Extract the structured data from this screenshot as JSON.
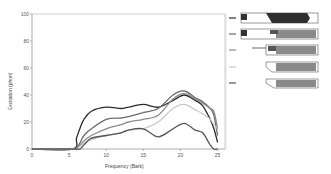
{
  "chart_data": {
    "type": "line",
    "title": "",
    "xlabel": "Frequency (Bark)",
    "ylabel": "Excitation (phon)",
    "xlim": [
      0,
      26
    ],
    "ylim": [
      0,
      100
    ],
    "xticks": [
      0,
      5,
      10,
      15,
      20,
      25
    ],
    "yticks": [
      0,
      20,
      40,
      60,
      80,
      100
    ],
    "grid": false,
    "legend_position": "right (schematic icons)",
    "x": [
      0,
      5.5,
      6,
      6.5,
      7,
      8,
      10,
      12,
      13,
      15,
      17,
      19,
      20.5,
      22,
      23,
      24,
      24.5,
      25
    ],
    "series": [
      {
        "name": "Curve 1",
        "color": "#2a2a2a",
        "values": [
          0,
          0,
          8,
          16,
          22,
          28,
          31,
          30,
          31,
          33,
          31,
          36,
          40,
          36,
          32,
          22,
          15,
          5
        ]
      },
      {
        "name": "Curve 2",
        "color": "#6a6a6a",
        "values": [
          0,
          0,
          0,
          5,
          10,
          15,
          22,
          23,
          24,
          27,
          30,
          40,
          43,
          38,
          35,
          30,
          25,
          10
        ]
      },
      {
        "name": "Curve 3",
        "color": "#8a8a8a",
        "values": [
          0,
          0,
          0,
          3,
          6,
          10,
          15,
          18,
          20,
          22,
          25,
          37,
          41,
          37,
          34,
          30,
          28,
          15
        ]
      },
      {
        "name": "Curve 4",
        "color": "#c8c8c8",
        "values": [
          0,
          0,
          0,
          2,
          4,
          7,
          10,
          12,
          14,
          15,
          20,
          30,
          33,
          29,
          26,
          22,
          18,
          15
        ]
      },
      {
        "name": "Curve 5",
        "color": "#555555",
        "values": [
          0,
          0,
          0,
          0,
          3,
          8,
          10,
          12,
          14,
          15,
          9,
          15,
          19,
          14,
          12,
          3,
          0,
          0
        ]
      }
    ]
  },
  "legend": {
    "items": [
      {
        "label": "Curve 1",
        "color": "#2a2a2a"
      },
      {
        "label": "Curve 2",
        "color": "#6a6a6a"
      },
      {
        "label": "Curve 3",
        "color": "#8a8a8a"
      },
      {
        "label": "Curve 4",
        "color": "#c8c8c8"
      },
      {
        "label": "Curve 5",
        "color": "#555555"
      }
    ]
  }
}
